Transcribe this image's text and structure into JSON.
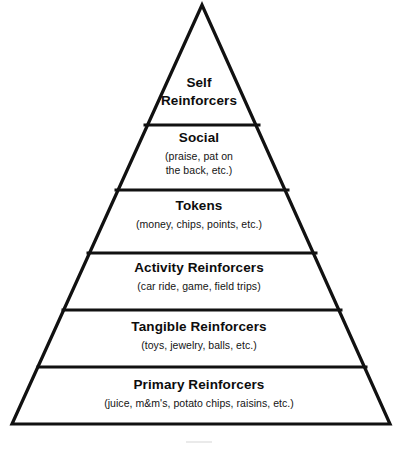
{
  "diagram": {
    "type": "pyramid",
    "orientation": "apex-up",
    "level_count": 6,
    "line_color": "#111111",
    "background_color": "#ffffff",
    "levels": [
      {
        "rank": 1,
        "position": "top",
        "title": "Self\nReinforcers",
        "title_line_1": "Self",
        "title_line_2": "Reinforcers",
        "subtitle": ""
      },
      {
        "rank": 2,
        "position": "second",
        "title": "Social",
        "subtitle": "(praise, pat on\nthe back, etc.)",
        "subtitle_line_1": "(praise, pat on",
        "subtitle_line_2": "the back, etc.)"
      },
      {
        "rank": 3,
        "position": "third",
        "title": "Tokens",
        "subtitle": "(money, chips, points, etc.)"
      },
      {
        "rank": 4,
        "position": "fourth",
        "title": "Activity Reinforcers",
        "subtitle": "(car ride, game, field trips)"
      },
      {
        "rank": 5,
        "position": "fifth",
        "title": "Tangible Reinforcers",
        "subtitle": "(toys, jewelry, balls, etc.)"
      },
      {
        "rank": 6,
        "position": "base",
        "title": "Primary Reinforcers",
        "subtitle": "(juice, m&m's,  potato chips, raisins, etc.)"
      }
    ]
  }
}
